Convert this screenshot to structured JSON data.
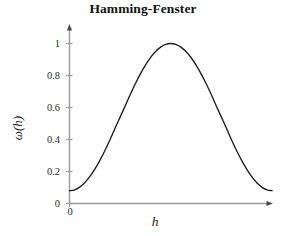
{
  "chart_data": {
    "type": "line",
    "title": "Hamming-Fenster",
    "xlabel": "h",
    "ylabel": "ω(h)",
    "grid": false,
    "legend": null,
    "xlim": [
      0,
      1
    ],
    "ylim": [
      0,
      1.08
    ],
    "xticks": [
      "0"
    ],
    "xtick_values": [
      0
    ],
    "yticks": [
      "0",
      "0.2",
      "0.4",
      "0.6",
      "0.8",
      "1"
    ],
    "ytick_values": [
      0,
      0.2,
      0.4,
      0.6,
      0.8,
      1
    ],
    "axis_color": "#9a9a9a",
    "curve_color": "#1c1c1c",
    "series": [
      {
        "name": "ω(h) = 0.54 − 0.46 cos(2πh)",
        "x": [
          0,
          0.025,
          0.05,
          0.075,
          0.1,
          0.125,
          0.15,
          0.175,
          0.2,
          0.225,
          0.25,
          0.275,
          0.3,
          0.325,
          0.35,
          0.375,
          0.4,
          0.425,
          0.45,
          0.475,
          0.5,
          0.525,
          0.55,
          0.575,
          0.6,
          0.625,
          0.65,
          0.675,
          0.7,
          0.725,
          0.75,
          0.775,
          0.8,
          0.825,
          0.85,
          0.875,
          0.9,
          0.925,
          0.95,
          0.975,
          1
        ],
        "values": [
          0.08,
          0.0857,
          0.1026,
          0.1301,
          0.1677,
          0.2146,
          0.2696,
          0.3315,
          0.3989,
          0.4703,
          0.54,
          0.6097,
          0.6811,
          0.7485,
          0.8104,
          0.8654,
          0.9123,
          0.9499,
          0.9774,
          0.9943,
          1.0,
          0.9943,
          0.9774,
          0.9499,
          0.9123,
          0.8654,
          0.8104,
          0.7485,
          0.6811,
          0.6097,
          0.54,
          0.4703,
          0.3989,
          0.3315,
          0.2696,
          0.2146,
          0.1677,
          0.1301,
          0.1026,
          0.0857,
          0.08
        ]
      }
    ],
    "annotations": {
      "peak_value": "1",
      "min_value": "0.08"
    }
  }
}
